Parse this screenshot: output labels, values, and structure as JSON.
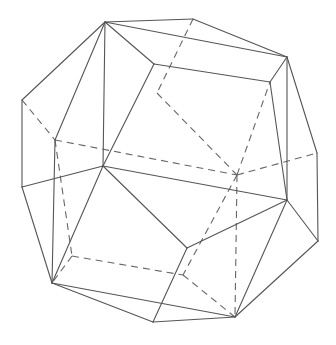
{
  "diagram": {
    "type": "polyhedron-wireframe",
    "colors": {
      "visible_edge": "#555555",
      "hidden_edge": "#666666",
      "background": "#ffffff"
    },
    "vertices": {
      "A": [
        105,
        22
      ],
      "B": [
        193,
        19
      ],
      "C": [
        287,
        57
      ],
      "D": [
        270,
        82
      ],
      "E": [
        154,
        64
      ],
      "F": [
        22,
        100
      ],
      "F2": [
        22,
        187
      ],
      "G": [
        55,
        140
      ],
      "H": [
        103,
        166
      ],
      "I": [
        237,
        175
      ],
      "J": [
        287,
        200
      ],
      "K": [
        317,
        153
      ],
      "R": [
        318,
        241
      ],
      "M": [
        52,
        283
      ],
      "N": [
        72,
        256
      ],
      "O": [
        153,
        322
      ],
      "P": [
        187,
        248
      ],
      "Q": [
        235,
        317
      ],
      "S": [
        183,
        275
      ],
      "T": [
        157,
        93
      ]
    },
    "visible_edges": [
      [
        "A",
        "B"
      ],
      [
        "B",
        "C"
      ],
      [
        "A",
        "C"
      ],
      [
        "A",
        "E"
      ],
      [
        "E",
        "D"
      ],
      [
        "D",
        "C"
      ],
      [
        "A",
        "F"
      ],
      [
        "A",
        "H"
      ],
      [
        "A",
        "G"
      ],
      [
        "E",
        "H"
      ],
      [
        "F",
        "F2"
      ],
      [
        "G",
        "M"
      ],
      [
        "F2",
        "H"
      ],
      [
        "F2",
        "M"
      ],
      [
        "H",
        "J"
      ],
      [
        "H",
        "P"
      ],
      [
        "H",
        "M"
      ],
      [
        "C",
        "J"
      ],
      [
        "D",
        "J"
      ],
      [
        "C",
        "K"
      ],
      [
        "K",
        "R"
      ],
      [
        "J",
        "R"
      ],
      [
        "J",
        "P"
      ],
      [
        "J",
        "Q"
      ],
      [
        "R",
        "Q"
      ],
      [
        "P",
        "O"
      ],
      [
        "M",
        "O"
      ],
      [
        "M",
        "Q"
      ],
      [
        "O",
        "Q"
      ]
    ],
    "hidden_edges": [
      [
        "F",
        "G"
      ],
      [
        "B",
        "T"
      ],
      [
        "T",
        "I"
      ],
      [
        "G",
        "I"
      ],
      [
        "I",
        "K"
      ],
      [
        "I",
        "D"
      ],
      [
        "I",
        "Q"
      ],
      [
        "I",
        "S"
      ],
      [
        "G",
        "N"
      ],
      [
        "N",
        "M"
      ],
      [
        "N",
        "S"
      ],
      [
        "S",
        "Q"
      ]
    ]
  }
}
